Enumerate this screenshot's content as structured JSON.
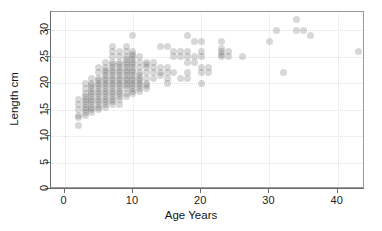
{
  "chart_data": {
    "type": "scatter",
    "title": "",
    "xlabel": "Age Years",
    "ylabel": "Length cm",
    "xlim": [
      -2,
      44
    ],
    "ylim": [
      0,
      33.5
    ],
    "xticks": [
      0,
      10,
      20,
      30,
      40
    ],
    "yticks": [
      0,
      5,
      10,
      15,
      20,
      25,
      30
    ],
    "grid": true,
    "legend": null,
    "marker": {
      "shape": "circle",
      "color": "#4d4d4d",
      "opacity": 0.22,
      "size_px": 7
    },
    "note": "Semi-transparent overlapping circles; darker tone indicates many coincident observations. Values lie on an integer-age by half-centimetre lattice.",
    "points": [
      [
        2,
        12
      ],
      [
        2,
        13.5
      ],
      [
        2,
        14
      ],
      [
        2,
        15
      ],
      [
        2,
        16
      ],
      [
        2,
        17
      ],
      [
        3,
        14
      ],
      [
        3,
        14.5
      ],
      [
        3,
        15
      ],
      [
        3,
        15.5
      ],
      [
        3,
        16
      ],
      [
        3,
        16.5
      ],
      [
        3,
        17
      ],
      [
        3,
        17.5
      ],
      [
        3,
        18
      ],
      [
        3,
        19
      ],
      [
        3,
        20
      ],
      [
        4,
        14.5
      ],
      [
        4,
        15
      ],
      [
        4,
        15.5
      ],
      [
        4,
        16
      ],
      [
        4,
        16.5
      ],
      [
        4,
        17
      ],
      [
        4,
        17.5
      ],
      [
        4,
        18
      ],
      [
        4,
        18.5
      ],
      [
        4,
        19
      ],
      [
        4,
        19.5
      ],
      [
        4,
        20
      ],
      [
        4,
        21
      ],
      [
        5,
        15
      ],
      [
        5,
        15.5
      ],
      [
        5,
        16
      ],
      [
        5,
        16.5
      ],
      [
        5,
        17
      ],
      [
        5,
        17.5
      ],
      [
        5,
        18
      ],
      [
        5,
        18.5
      ],
      [
        5,
        19
      ],
      [
        5,
        19.5
      ],
      [
        5,
        20
      ],
      [
        5,
        20.5
      ],
      [
        5,
        21
      ],
      [
        5,
        22
      ],
      [
        5,
        23
      ],
      [
        6,
        15.5
      ],
      [
        6,
        16
      ],
      [
        6,
        16.5
      ],
      [
        6,
        17
      ],
      [
        6,
        17.5
      ],
      [
        6,
        18
      ],
      [
        6,
        18.5
      ],
      [
        6,
        19
      ],
      [
        6,
        19.5
      ],
      [
        6,
        20
      ],
      [
        6,
        20.5
      ],
      [
        6,
        21
      ],
      [
        6,
        21.5
      ],
      [
        6,
        22
      ],
      [
        6,
        22.5
      ],
      [
        6,
        23
      ],
      [
        6,
        24
      ],
      [
        7,
        16
      ],
      [
        7,
        16.5
      ],
      [
        7,
        17
      ],
      [
        7,
        17.5
      ],
      [
        7,
        18
      ],
      [
        7,
        18.5
      ],
      [
        7,
        19
      ],
      [
        7,
        19.5
      ],
      [
        7,
        20
      ],
      [
        7,
        20.5
      ],
      [
        7,
        21
      ],
      [
        7,
        21.5
      ],
      [
        7,
        22
      ],
      [
        7,
        22.5
      ],
      [
        7,
        23
      ],
      [
        7,
        23.5
      ],
      [
        7,
        24
      ],
      [
        7,
        25
      ],
      [
        7,
        26
      ],
      [
        7,
        27
      ],
      [
        8,
        16
      ],
      [
        8,
        17
      ],
      [
        8,
        17.5
      ],
      [
        8,
        18
      ],
      [
        8,
        18.5
      ],
      [
        8,
        19
      ],
      [
        8,
        19.5
      ],
      [
        8,
        20
      ],
      [
        8,
        20.5
      ],
      [
        8,
        21
      ],
      [
        8,
        21.5
      ],
      [
        8,
        22
      ],
      [
        8,
        22.5
      ],
      [
        8,
        23
      ],
      [
        8,
        23.5
      ],
      [
        8,
        24
      ],
      [
        8,
        25
      ],
      [
        8,
        26
      ],
      [
        9,
        17.5
      ],
      [
        9,
        18
      ],
      [
        9,
        19
      ],
      [
        9,
        19.5
      ],
      [
        9,
        20
      ],
      [
        9,
        20.5
      ],
      [
        9,
        21
      ],
      [
        9,
        21.5
      ],
      [
        9,
        22
      ],
      [
        9,
        22.5
      ],
      [
        9,
        23
      ],
      [
        9,
        23.5
      ],
      [
        9,
        24
      ],
      [
        9,
        24.5
      ],
      [
        9,
        25
      ],
      [
        9,
        26
      ],
      [
        9,
        27
      ],
      [
        10,
        18
      ],
      [
        10,
        18.5
      ],
      [
        10,
        19
      ],
      [
        10,
        19.5
      ],
      [
        10,
        20
      ],
      [
        10,
        20.5
      ],
      [
        10,
        21
      ],
      [
        10,
        21.5
      ],
      [
        10,
        22
      ],
      [
        10,
        22.5
      ],
      [
        10,
        23
      ],
      [
        10,
        23.5
      ],
      [
        10,
        24
      ],
      [
        10,
        24.5
      ],
      [
        10,
        25
      ],
      [
        10,
        25.5
      ],
      [
        10,
        26
      ],
      [
        10,
        29
      ],
      [
        11,
        18.5
      ],
      [
        11,
        19
      ],
      [
        11,
        19.5
      ],
      [
        11,
        20
      ],
      [
        11,
        20.5
      ],
      [
        11,
        21
      ],
      [
        11,
        21.5
      ],
      [
        11,
        22
      ],
      [
        11,
        23
      ],
      [
        11,
        24
      ],
      [
        11,
        25
      ],
      [
        12,
        19
      ],
      [
        12,
        19.5
      ],
      [
        12,
        20
      ],
      [
        12,
        21
      ],
      [
        12,
        22
      ],
      [
        12,
        23
      ],
      [
        12,
        23.5
      ],
      [
        12,
        24
      ],
      [
        13,
        21
      ],
      [
        13,
        22
      ],
      [
        13,
        23
      ],
      [
        13,
        24
      ],
      [
        14,
        21.5
      ],
      [
        14,
        22
      ],
      [
        14,
        23
      ],
      [
        14,
        27
      ],
      [
        15,
        20
      ],
      [
        15,
        21
      ],
      [
        15,
        22
      ],
      [
        15,
        23
      ],
      [
        15,
        27
      ],
      [
        16,
        22
      ],
      [
        16,
        25
      ],
      [
        16,
        26
      ],
      [
        17,
        21
      ],
      [
        17,
        25
      ],
      [
        17,
        26
      ],
      [
        18,
        21
      ],
      [
        18,
        22
      ],
      [
        18,
        24
      ],
      [
        18,
        25
      ],
      [
        18,
        26
      ],
      [
        18,
        29
      ],
      [
        19,
        24
      ],
      [
        19,
        25
      ],
      [
        19,
        28
      ],
      [
        20,
        20
      ],
      [
        20,
        22
      ],
      [
        20,
        23
      ],
      [
        20,
        25
      ],
      [
        20,
        26
      ],
      [
        20,
        28
      ],
      [
        21,
        22
      ],
      [
        21,
        23
      ],
      [
        23,
        25
      ],
      [
        23,
        25.5
      ],
      [
        23,
        26
      ],
      [
        23,
        26.5
      ],
      [
        23,
        28
      ],
      [
        24,
        25
      ],
      [
        24,
        26
      ],
      [
        26,
        25
      ],
      [
        30,
        28
      ],
      [
        31,
        30
      ],
      [
        32,
        22
      ],
      [
        34,
        30
      ],
      [
        34,
        32
      ],
      [
        35,
        30
      ],
      [
        36,
        29
      ],
      [
        43,
        26
      ]
    ]
  }
}
